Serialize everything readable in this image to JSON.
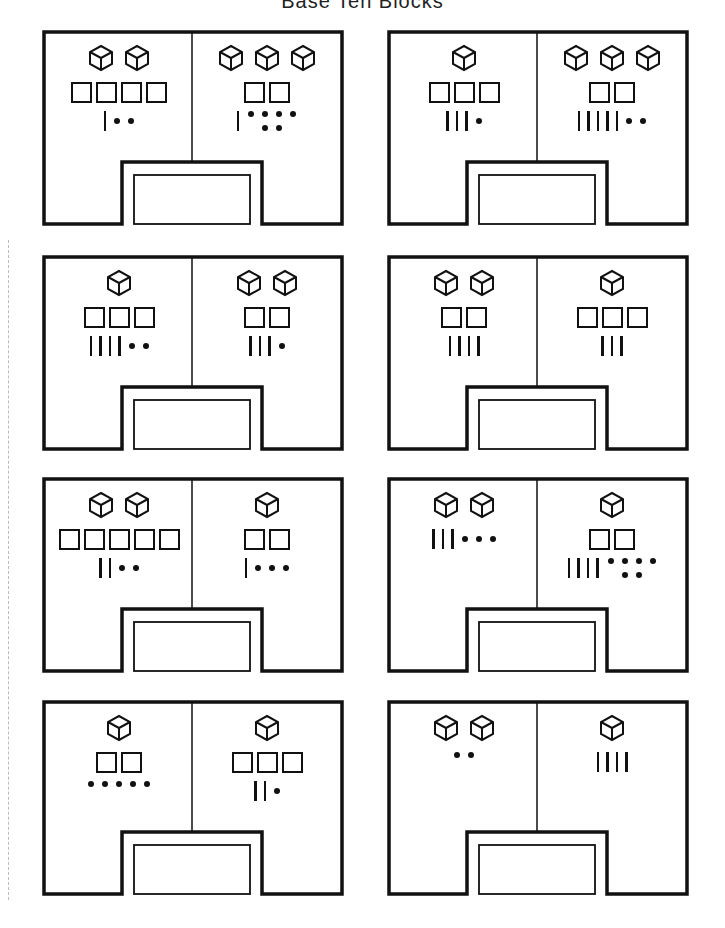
{
  "page": {
    "title": "Base Ten Blocks",
    "colors": {
      "ink": "#111111",
      "paper": "#ffffff"
    }
  },
  "legend": {
    "cube": "thousand-cube",
    "flat": "hundred-flat",
    "rod": "ten-rod",
    "unit": "one-unit"
  },
  "panels": [
    {
      "left": {
        "cubes": 2,
        "flats": 4,
        "rods": 1,
        "units": 2
      },
      "right": {
        "cubes": 3,
        "flats": 2,
        "rods": 1,
        "units": 6
      }
    },
    {
      "left": {
        "cubes": 1,
        "flats": 3,
        "rods": 3,
        "units": 1
      },
      "right": {
        "cubes": 3,
        "flats": 2,
        "rods": 5,
        "units": 2
      }
    },
    {
      "left": {
        "cubes": 1,
        "flats": 3,
        "rods": 4,
        "units": 2
      },
      "right": {
        "cubes": 2,
        "flats": 2,
        "rods": 3,
        "units": 1
      }
    },
    {
      "left": {
        "cubes": 2,
        "flats": 2,
        "rods": 4,
        "units": 0
      },
      "right": {
        "cubes": 1,
        "flats": 3,
        "rods": 3,
        "units": 0
      }
    },
    {
      "left": {
        "cubes": 2,
        "flats": 5,
        "rods": 2,
        "units": 2
      },
      "right": {
        "cubes": 1,
        "flats": 2,
        "rods": 1,
        "units": 3
      }
    },
    {
      "left": {
        "cubes": 2,
        "flats": 0,
        "rods": 3,
        "units": 3
      },
      "right": {
        "cubes": 1,
        "flats": 2,
        "rods": 4,
        "units": 6
      }
    },
    {
      "left": {
        "cubes": 1,
        "flats": 2,
        "rods": 0,
        "units": 5
      },
      "right": {
        "cubes": 1,
        "flats": 3,
        "rods": 2,
        "units": 1
      }
    },
    {
      "left": {
        "cubes": 2,
        "flats": 0,
        "rods": 0,
        "units": 2
      },
      "right": {
        "cubes": 1,
        "flats": 0,
        "rods": 4,
        "units": 0
      }
    }
  ],
  "answer_boxes": [
    "",
    "",
    "",
    "",
    "",
    "",
    "",
    ""
  ]
}
